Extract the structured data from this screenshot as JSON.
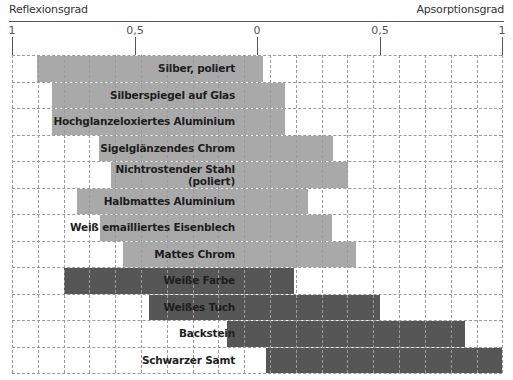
{
  "header": {
    "left_title": "Reflexionsgrad",
    "right_title": "Apsorptionsgrad"
  },
  "axis": {
    "ticks": [
      {
        "label": "1",
        "x": 12
      },
      {
        "label": "0,5",
        "x": 135
      },
      {
        "label": "0",
        "x": 257
      },
      {
        "label": "0,5",
        "x": 380
      },
      {
        "label": "1",
        "x": 502
      }
    ]
  },
  "colors": {
    "light_bar": "#a9a9a9",
    "dark_bar": "#565656",
    "grid": "#9a9a9a"
  },
  "chart_data": {
    "type": "bar",
    "orientation": "horizontal-diverging",
    "title": "",
    "xlabel_left": "Reflexionsgrad",
    "xlabel_right": "Apsorptionsgrad",
    "tick_labels": [
      "1",
      "0,5",
      "0",
      "0,5",
      "1"
    ],
    "xlim": [
      -1,
      1
    ],
    "grid": true,
    "categories": [
      "Silber, poliert",
      "Silberspiegel auf Glas",
      "Hochglanzeloxiertes Aluminium",
      "Sigelglänzendes Chrom",
      "Nichtrostender Stahl (poliert)",
      "Halbmattes Aluminium",
      "Weiß emailliertes Eisenblech",
      "Mattes Chrom",
      "Weiße Farbe",
      "Weißes Tuch",
      "Backstein",
      "Schwarzer Samt"
    ],
    "series": [
      {
        "name": "Reflexionsgrad",
        "values": [
          0.9,
          0.84,
          0.84,
          0.64,
          0.6,
          0.73,
          0.64,
          0.55,
          0.79,
          0.44,
          0.12,
          0.0
        ]
      },
      {
        "name": "Apsorptionsgrad",
        "values": [
          0.03,
          0.11,
          0.11,
          0.31,
          0.37,
          0.21,
          0.31,
          0.4,
          0.15,
          0.5,
          0.85,
          1.0
        ]
      }
    ],
    "bar_shade": [
      "light",
      "light",
      "light",
      "light",
      "light",
      "light",
      "light",
      "light",
      "dark",
      "dark",
      "dark",
      "dark"
    ]
  },
  "rows": [
    {
      "label": "Silber, poliert",
      "left": 25,
      "right": 251,
      "shade": "light"
    },
    {
      "label": "Silberspiegel auf Glas",
      "left": 40,
      "right": 273,
      "shade": "light"
    },
    {
      "label": "Hochglanzeloxiertes Aluminium",
      "left": 40,
      "right": 273,
      "shade": "light"
    },
    {
      "label": "Sigelglänzendes Chrom",
      "left": 87,
      "right": 321,
      "shade": "light"
    },
    {
      "label": "Nichtrostender Stahl\n(poliert)",
      "left": 99,
      "right": 336,
      "shade": "light"
    },
    {
      "label": "Halbmattes Aluminium",
      "left": 65,
      "right": 296,
      "shade": "light"
    },
    {
      "label": "Weiß emailliertes Eisenblech",
      "left": 88,
      "right": 320,
      "shade": "light"
    },
    {
      "label": "Mattes Chrom",
      "left": 111,
      "right": 344,
      "shade": "light"
    },
    {
      "label": "Weiße Farbe",
      "left": 52,
      "right": 282,
      "shade": "dark"
    },
    {
      "label": "Weißes Tuch",
      "left": 137,
      "right": 368,
      "shade": "dark"
    },
    {
      "label": "Backstein",
      "left": 215,
      "right": 453,
      "shade": "dark"
    },
    {
      "label": "Schwarzer Samt",
      "left": 254,
      "right": 490,
      "shade": "dark"
    }
  ]
}
